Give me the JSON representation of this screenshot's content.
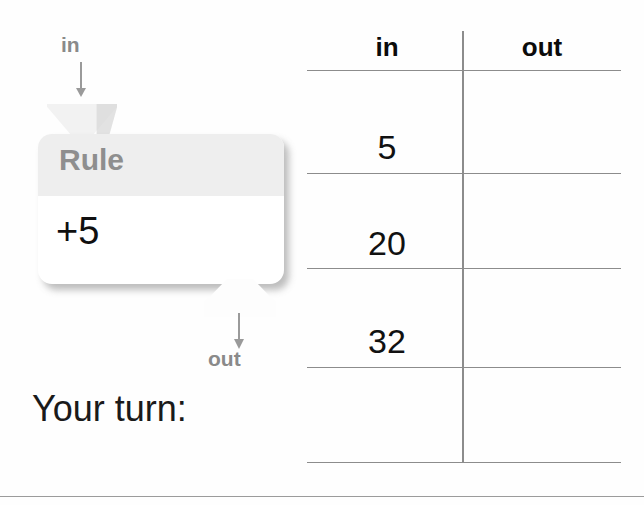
{
  "diagram": {
    "input_label": "in",
    "output_label": "out",
    "rule_title": "Rule",
    "rule_expression": "+5",
    "prompt": "Your turn:",
    "icons": {
      "input_arrow": "arrow-down-icon",
      "output_arrow": "arrow-down-icon",
      "input_funnel": "funnel-tab-icon",
      "output_funnel": "funnel-tab-icon"
    }
  },
  "table": {
    "columns": [
      "in",
      "out"
    ],
    "rows": [
      {
        "in": "5",
        "out": ""
      },
      {
        "in": "20",
        "out": ""
      },
      {
        "in": "32",
        "out": ""
      },
      {
        "in": "",
        "out": ""
      }
    ]
  },
  "colors": {
    "label_gray": "#8a8a8a",
    "rule_header_bg": "#eeeeee",
    "text_black": "#111111",
    "rule_line": "#8c8c8c"
  }
}
